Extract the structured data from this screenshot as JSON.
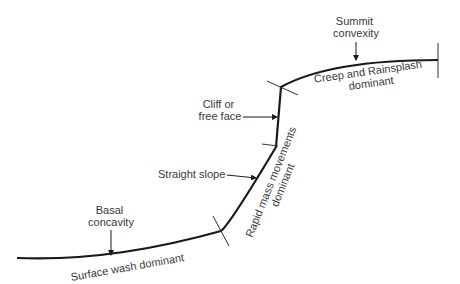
{
  "diagram": {
    "type": "hillslope-profile",
    "stroke_color": "#1a1a1a",
    "text_color": "#3a3a3a",
    "labels": {
      "summit_line1": "Summit",
      "summit_line2": "convexity",
      "cliff_line1": "Cliff or",
      "cliff_line2": "free face",
      "straight": "Straight slope",
      "basal_line1": "Basal",
      "basal_line2": "concavity"
    },
    "process_labels": {
      "creep_line1": "Creep and Rainsplash",
      "creep_line2": "dominant",
      "mass_line1": "Rapid mass movements",
      "mass_line2": "dominant",
      "wash": "Surface wash dominant"
    }
  }
}
